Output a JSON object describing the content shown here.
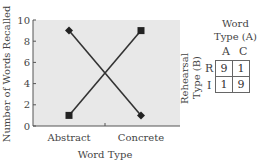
{
  "chart_data": {
    "type": "line",
    "title": "",
    "xlabel": "Word Type",
    "ylabel": "Number of Words Recalled",
    "categories": [
      "Abstract",
      "Concrete"
    ],
    "ylim": [
      0,
      10
    ],
    "yticks": [
      "0",
      "2",
      "4",
      "6",
      "8",
      "10"
    ],
    "grid": false,
    "legend": "none",
    "series": [
      {
        "name": "Rote rehearsal (diamond)",
        "marker": "diamond",
        "values": [
          9,
          1
        ]
      },
      {
        "name": "Imagery rehearsal (square)",
        "marker": "square",
        "values": [
          1,
          9
        ]
      }
    ],
    "background": "#e8e8e8",
    "line_color": "#333333"
  },
  "table": {
    "col_header_line1": "Word",
    "col_header_line2": "Type (A)",
    "col_labels": [
      "A",
      "C"
    ],
    "row_header_line1": "Rehearsal",
    "row_header_line2": "Type (B)",
    "row_labels": [
      "R",
      "I"
    ],
    "cells": [
      [
        "9",
        "1"
      ],
      [
        "1",
        "9"
      ]
    ]
  }
}
